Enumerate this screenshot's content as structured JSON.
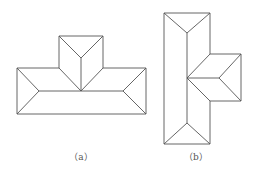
{
  "figures": [
    {
      "label": "（a）",
      "description": "T-shaped hip roof plan, horizontal main body with a wing projecting upward"
    },
    {
      "label": "（b）",
      "description": "T-shaped hip roof plan, vertical main body with a wing projecting right"
    }
  ],
  "colors": {
    "line": "#555555",
    "background": "#ffffff"
  }
}
